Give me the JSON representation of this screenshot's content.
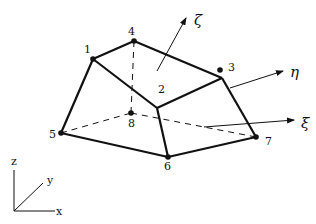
{
  "diagram": {
    "type": "hexahedral-element",
    "nodes": [
      {
        "id": "1",
        "label": "1"
      },
      {
        "id": "2",
        "label": "2"
      },
      {
        "id": "3",
        "label": "3"
      },
      {
        "id": "4",
        "label": "4"
      },
      {
        "id": "5",
        "label": "5"
      },
      {
        "id": "6",
        "label": "6"
      },
      {
        "id": "7",
        "label": "7"
      },
      {
        "id": "8",
        "label": "8"
      }
    ],
    "local_axes": {
      "zeta": "ζ",
      "eta": "η",
      "xi": "ξ"
    },
    "global_axes": {
      "x": "x",
      "y": "y",
      "z": "z"
    },
    "colors": {
      "line": "#111111",
      "background": "#ffffff"
    }
  }
}
